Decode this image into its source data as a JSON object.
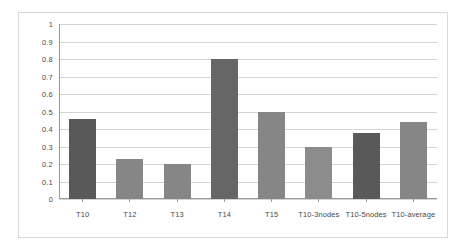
{
  "chart_data": {
    "type": "bar",
    "title": "",
    "subtitle": "",
    "xlabel": "",
    "ylabel": "",
    "categories": [
      "T10",
      "T12",
      "T13",
      "T14",
      "T15",
      "T10-3nodes",
      "T10-5nodes",
      "T10-average"
    ],
    "values": [
      0.46,
      0.23,
      0.2,
      0.8,
      0.5,
      0.3,
      0.375,
      0.44
    ],
    "series": [
      {
        "name": "",
        "values": [
          0.46,
          0.23,
          0.2,
          0.8,
          0.5,
          0.3,
          0.375,
          0.44
        ]
      }
    ],
    "bar_colors": [
      "#595959",
      "#868686",
      "#868686",
      "#666666",
      "#868686",
      "#8c8c8c",
      "#595959",
      "#868686"
    ],
    "ylim": [
      0,
      1
    ],
    "ytick_values": [
      1,
      0.9,
      0.8,
      0.7,
      0.6,
      0.5,
      0.4,
      0.3,
      0.2,
      0.1,
      0
    ],
    "ytick_labels": [
      "1",
      "0.9",
      "0.8",
      "0.7",
      "0.6",
      "0.5",
      "0.4",
      "0.3",
      "0.2",
      "0.1",
      "0"
    ],
    "grid": {
      "horizontal": true,
      "vertical": false,
      "color": "#d4d4d4"
    },
    "legend": {
      "visible": false,
      "position": "none",
      "entries": []
    },
    "annotations": [],
    "data_labels_visible": false,
    "plot_background": "#ffffff",
    "frame_border_color": "#d9d9d9",
    "axis_color": "#9a9a9a"
  }
}
